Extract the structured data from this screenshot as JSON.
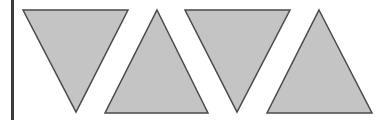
{
  "canvas": {
    "width": 391,
    "height": 120,
    "background": "#ffffff"
  },
  "colors": {
    "fill": "#c4c4c4",
    "stroke": "#4a4a4a",
    "bar": "#3a3a3a"
  },
  "left_bar": {
    "x": 12,
    "width": 3
  },
  "triangles": [
    {
      "orientation": "down",
      "points": "23,10 128,10 76,112"
    },
    {
      "orientation": "up",
      "points": "157,10 208,113 105,113"
    },
    {
      "orientation": "down",
      "points": "185,10 290,10 237,112"
    },
    {
      "orientation": "up",
      "points": "319,10 372,113 267,113"
    }
  ]
}
